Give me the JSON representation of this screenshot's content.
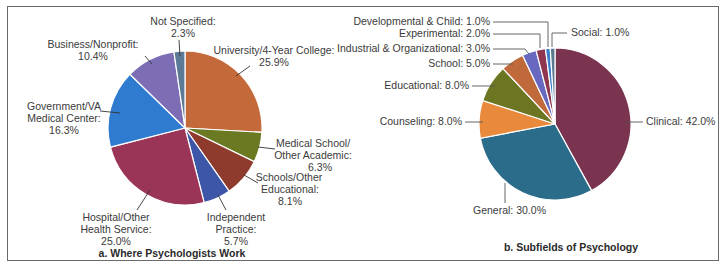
{
  "chart_data": [
    {
      "type": "pie",
      "title": "a. Where Psychologists Work",
      "categories": [
        "University/4-Year College",
        "Medical School/ Other Academic",
        "Schools/Other Educational",
        "Independent Practice",
        "Hospital/Other Health Service",
        "Government/VA Medical Center",
        "Business/Nonprofit",
        "Not Specified"
      ],
      "values": [
        25.9,
        6.3,
        8.1,
        5.7,
        25.0,
        16.3,
        10.4,
        2.3
      ],
      "colors": [
        "#C4693A",
        "#6B7A22",
        "#8E3B2E",
        "#3D56A8",
        "#9B3557",
        "#2F7BD0",
        "#7C6DB5",
        "#5C7A95"
      ],
      "labels": {
        "university": [
          "University/4-Year College:",
          "25.9%"
        ],
        "medical": [
          "Medical School/",
          "Other Academic:",
          "6.3%"
        ],
        "schools": [
          "Schools/Other",
          "Educational:",
          "8.1%"
        ],
        "independent": [
          "Independent",
          "Practice:",
          "5.7%"
        ],
        "hospital": [
          "Hospital/Other",
          "Health Service:",
          "25.0%"
        ],
        "government": [
          "Government/VA",
          "Medical Center:",
          "16.3%"
        ],
        "business": [
          "Business/Nonprofit:",
          "10.4%"
        ],
        "not_specified": [
          "Not Specified:",
          "2.3%"
        ]
      },
      "legend": "none (leader-line labels)"
    },
    {
      "type": "pie",
      "title": "b. Subfields of Psychology",
      "categories": [
        "Clinical",
        "General",
        "Counseling",
        "Educational",
        "School",
        "Industrial & Organizational",
        "Experimental",
        "Developmental & Child",
        "Social"
      ],
      "values": [
        42.0,
        30.0,
        8.0,
        8.0,
        5.0,
        3.0,
        2.0,
        1.0,
        1.0
      ],
      "colors": [
        "#7A3450",
        "#2B6C8A",
        "#E8893C",
        "#6B7522",
        "#C06A3C",
        "#6868C0",
        "#8E3550",
        "#3A7FC8",
        "#5A7890"
      ],
      "labels": {
        "clinical": "Clinical: 42.0%",
        "general": "General: 30.0%",
        "counseling": "Counseling: 8.0%",
        "educational": "Educational: 8.0%",
        "school": "School: 5.0%",
        "industrial": "Industrial & Organizational: 3.0%",
        "experimental": "Experimental: 2.0%",
        "developmental": "Developmental & Child: 1.0%",
        "social": "Social: 1.0%"
      },
      "legend": "none (leader-line labels)"
    }
  ]
}
